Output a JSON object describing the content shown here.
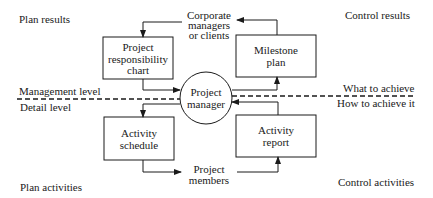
{
  "diagram": {
    "corner_labels": {
      "top_left": "Plan results",
      "top_right": "Control results",
      "bottom_left": "Plan activities",
      "bottom_right": "Control activities"
    },
    "level_labels": {
      "upper_left": "Management level",
      "lower_left": "Detail level",
      "upper_right": "What to achieve",
      "lower_right": "How to achieve it"
    },
    "center_node": {
      "line1": "Project",
      "line2": "manager"
    },
    "stakeholders": {
      "top": {
        "line1": "Corporate",
        "line2": "managers",
        "line3": "or clients"
      },
      "bottom": {
        "line1": "Project",
        "line2": "members"
      }
    },
    "boxes": [
      {
        "id": "responsibility-chart",
        "line1": "Project",
        "line2": "responsibility",
        "line3": "chart"
      },
      {
        "id": "milestone-plan",
        "line1": "Milestone",
        "line2": "plan"
      },
      {
        "id": "activity-schedule",
        "line1": "Activity",
        "line2": "schedule"
      },
      {
        "id": "activity-report",
        "line1": "Activity",
        "line2": "report"
      }
    ],
    "flows": [
      "Corporate managers or clients -> Project responsibility chart",
      "Project responsibility chart -> Project manager",
      "Project manager -> Milestone plan",
      "Milestone plan -> Corporate managers or clients",
      "Project manager -> Activity schedule",
      "Activity schedule -> Project members",
      "Project members -> Activity report",
      "Activity report -> Project manager"
    ]
  }
}
